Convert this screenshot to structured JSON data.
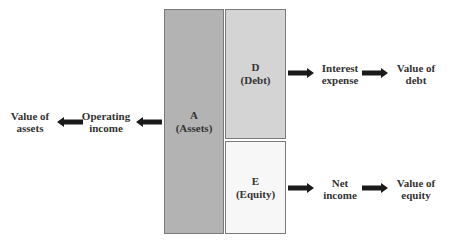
{
  "boxes": {
    "assets": {
      "letter": "A",
      "name": "(Assets)",
      "fill": "#b3b3b3"
    },
    "debt": {
      "letter": "D",
      "name": "(Debt)",
      "fill": "#d4d4d4"
    },
    "equity": {
      "letter": "E",
      "name": "(Equity)",
      "fill": "#f7f7f7"
    }
  },
  "left_flow": {
    "operating_income": [
      "Operating",
      "income"
    ],
    "value_of_assets": [
      "Value of",
      "assets"
    ]
  },
  "debt_flow": {
    "interest_expense": [
      "Interest",
      "expense"
    ],
    "value_of_debt": [
      "Value of",
      "debt"
    ]
  },
  "equity_flow": {
    "net_income": [
      "Net",
      "income"
    ],
    "value_of_equity": [
      "Value of",
      "equity"
    ]
  },
  "colors": {
    "arrow": "#1a1a1a",
    "border": "#7a7a7a"
  }
}
